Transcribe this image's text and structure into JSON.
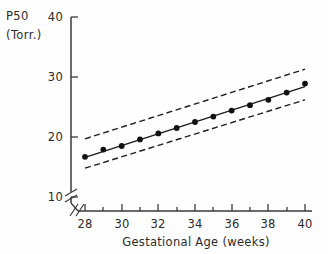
{
  "chart_data": {
    "type": "scatter",
    "title": "",
    "subtitle": "",
    "xlabel": "Gestational Age (weeks)",
    "ylabel": "P50",
    "ylabel_units": "(Torr.)",
    "ylabel_full": "P50 (Torr.)",
    "xlim": [
      28,
      40
    ],
    "ylim": [
      10,
      40
    ],
    "grid": false,
    "legend_position": "none",
    "axis_break": {
      "x": true,
      "y": true,
      "note": "double-slash break near origin"
    },
    "y_ticks": [
      10,
      20,
      30,
      40
    ],
    "y_tick_labels": [
      "10",
      "20",
      "30",
      "40"
    ],
    "x_ticks": [
      28,
      29,
      30,
      31,
      32,
      33,
      34,
      35,
      36,
      37,
      38,
      39,
      40
    ],
    "x_tick_labels": [
      "28",
      "",
      "30",
      "",
      "32",
      "",
      "34",
      "",
      "36",
      "",
      "38",
      "",
      "40"
    ],
    "x_major_ticks": [
      28,
      30,
      32,
      34,
      36,
      38,
      40
    ],
    "x": [
      28,
      29,
      30,
      31,
      32,
      33,
      34,
      35,
      36,
      37,
      38,
      39,
      40
    ],
    "values": [
      16.7,
      17.9,
      18.5,
      19.6,
      20.6,
      21.5,
      22.5,
      23.4,
      24.4,
      25.3,
      26.2,
      27.4,
      28.9
    ],
    "series": [
      {
        "name": "observed P50 means",
        "style": "markers",
        "marker": "filled-circle",
        "x": [
          28,
          29,
          30,
          31,
          32,
          33,
          34,
          35,
          36,
          37,
          38,
          39,
          40
        ],
        "values": [
          16.7,
          17.9,
          18.5,
          19.6,
          20.6,
          21.5,
          22.5,
          23.4,
          24.4,
          25.3,
          26.2,
          27.4,
          28.9
        ]
      },
      {
        "name": "regression line",
        "style": "solid-line",
        "x": [
          28,
          40
        ],
        "values": [
          16.6,
          28.4
        ]
      },
      {
        "name": "upper confidence limit",
        "style": "dashed-line",
        "x": [
          28,
          40
        ],
        "values": [
          19.7,
          31.3
        ]
      },
      {
        "name": "lower confidence limit",
        "style": "dashed-line",
        "x": [
          28,
          40
        ],
        "values": [
          14.8,
          26.2
        ]
      }
    ],
    "n_points": 13,
    "trend": "increasing"
  }
}
